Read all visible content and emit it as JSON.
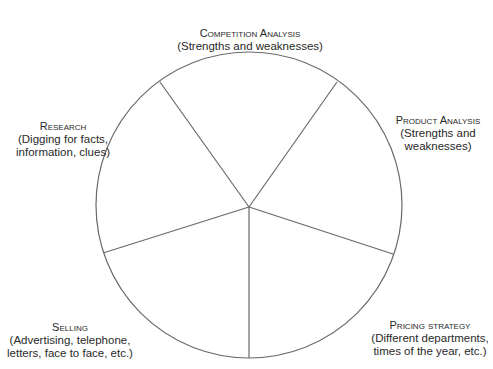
{
  "diagram": {
    "type": "wheel",
    "style": {
      "stroke_color": "#6a6a6a",
      "text_color": "#2a2a2a",
      "background": "#ffffff"
    },
    "segments": [
      {
        "id": "competition-analysis",
        "title": "Competition Analysis",
        "description_lines": [
          "(Strengths and weaknesses)"
        ]
      },
      {
        "id": "product-analysis",
        "title": "Product Analysis",
        "description_lines": [
          "(Strengths and",
          "weaknesses)"
        ]
      },
      {
        "id": "pricing-strategy",
        "title": "Pricing strategy",
        "description_lines": [
          "(Different departments,",
          "times of the year, etc.)"
        ]
      },
      {
        "id": "selling",
        "title": "Selling",
        "description_lines": [
          "(Advertising, telephone,",
          "letters, face to face, etc.)"
        ]
      },
      {
        "id": "research",
        "title": "Research",
        "description_lines": [
          "(Digging for facts,",
          "information, clues)"
        ]
      }
    ]
  }
}
